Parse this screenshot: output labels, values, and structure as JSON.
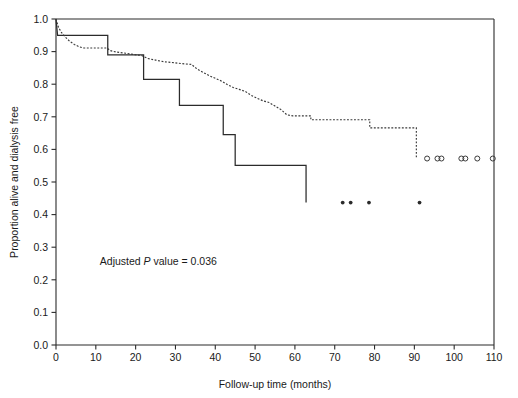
{
  "chart_data": {
    "type": "line",
    "title": "",
    "subtitle": "",
    "xlabel": "Follow-up time (months)",
    "ylabel": "Proportion alive and dialysis free",
    "xlim": [
      0,
      110
    ],
    "ylim": [
      0.0,
      1.0
    ],
    "xticks": [
      0,
      10,
      20,
      30,
      40,
      50,
      60,
      70,
      80,
      90,
      100,
      110
    ],
    "xticklabels": [
      "0",
      "10",
      "20",
      "30",
      "40",
      "50",
      "60",
      "70",
      "80",
      "90",
      "100",
      "110"
    ],
    "yticks": [
      0.0,
      0.1,
      0.2,
      0.3,
      0.4,
      0.5,
      0.6,
      0.7,
      0.8,
      0.9,
      1.0
    ],
    "yticklabels": [
      "0.0",
      "0.1",
      "0.2",
      "0.3",
      "0.4",
      "0.5",
      "0.6",
      "0.7",
      "0.8",
      "0.9",
      "1.0"
    ],
    "grid": false,
    "legend": "none",
    "annotations": [
      {
        "name": "adjusted-p-value",
        "text_before": "Adjusted ",
        "text_italic": "P",
        "text_after": " value = 0.036",
        "x": 11,
        "y": 0.245
      }
    ],
    "series": [
      {
        "name": "group-solid",
        "style": "solid",
        "color": "#2b2b2b",
        "step": "post",
        "points": [
          {
            "x": 0,
            "y": 1.0
          },
          {
            "x": 0.4,
            "y": 0.95
          },
          {
            "x": 13.0,
            "y": 0.95
          },
          {
            "x": 13.0,
            "y": 0.89
          },
          {
            "x": 22.0,
            "y": 0.89
          },
          {
            "x": 22.0,
            "y": 0.815
          },
          {
            "x": 31.0,
            "y": 0.815
          },
          {
            "x": 31.0,
            "y": 0.735
          },
          {
            "x": 42.0,
            "y": 0.735
          },
          {
            "x": 42.0,
            "y": 0.645
          },
          {
            "x": 45.0,
            "y": 0.645
          },
          {
            "x": 45.0,
            "y": 0.551
          },
          {
            "x": 62.8,
            "y": 0.551
          },
          {
            "x": 62.8,
            "y": 0.437
          }
        ],
        "censor_marker": "filled-dot",
        "censor_points": [
          {
            "x": 72.0,
            "y": 0.437
          },
          {
            "x": 74.0,
            "y": 0.437
          },
          {
            "x": 78.6,
            "y": 0.437
          },
          {
            "x": 91.3,
            "y": 0.437
          }
        ]
      },
      {
        "name": "group-dotted",
        "style": "dotted",
        "color": "#3a3a3a",
        "step": "post",
        "points": [
          {
            "x": 0.0,
            "y": 1.0
          },
          {
            "x": 0.6,
            "y": 0.975
          },
          {
            "x": 1.4,
            "y": 0.958
          },
          {
            "x": 2.4,
            "y": 0.944
          },
          {
            "x": 3.4,
            "y": 0.932
          },
          {
            "x": 4.6,
            "y": 0.922
          },
          {
            "x": 5.8,
            "y": 0.915
          },
          {
            "x": 7.0,
            "y": 0.911
          },
          {
            "x": 12.8,
            "y": 0.911
          },
          {
            "x": 13.6,
            "y": 0.903
          },
          {
            "x": 15.0,
            "y": 0.899
          },
          {
            "x": 17.5,
            "y": 0.895
          },
          {
            "x": 19.5,
            "y": 0.891
          },
          {
            "x": 21.5,
            "y": 0.888
          },
          {
            "x": 23.0,
            "y": 0.879
          },
          {
            "x": 25.0,
            "y": 0.874
          },
          {
            "x": 27.0,
            "y": 0.869
          },
          {
            "x": 29.5,
            "y": 0.866
          },
          {
            "x": 32.5,
            "y": 0.862
          },
          {
            "x": 34.0,
            "y": 0.861
          },
          {
            "x": 35.5,
            "y": 0.846
          },
          {
            "x": 37.0,
            "y": 0.836
          },
          {
            "x": 38.5,
            "y": 0.826
          },
          {
            "x": 40.0,
            "y": 0.818
          },
          {
            "x": 41.5,
            "y": 0.81
          },
          {
            "x": 43.0,
            "y": 0.799
          },
          {
            "x": 44.5,
            "y": 0.79
          },
          {
            "x": 46.0,
            "y": 0.784
          },
          {
            "x": 47.5,
            "y": 0.778
          },
          {
            "x": 49.0,
            "y": 0.766
          },
          {
            "x": 50.5,
            "y": 0.757
          },
          {
            "x": 52.0,
            "y": 0.749
          },
          {
            "x": 53.5,
            "y": 0.744
          },
          {
            "x": 55.0,
            "y": 0.733
          },
          {
            "x": 56.5,
            "y": 0.722
          },
          {
            "x": 58.0,
            "y": 0.706
          },
          {
            "x": 59.5,
            "y": 0.703
          },
          {
            "x": 64.0,
            "y": 0.703
          },
          {
            "x": 64.0,
            "y": 0.691
          },
          {
            "x": 78.8,
            "y": 0.691
          },
          {
            "x": 78.8,
            "y": 0.666
          },
          {
            "x": 90.5,
            "y": 0.666
          },
          {
            "x": 90.5,
            "y": 0.572
          }
        ],
        "censor_marker": "open-circle",
        "censor_points": [
          {
            "x": 93.2,
            "y": 0.572
          },
          {
            "x": 95.8,
            "y": 0.572
          },
          {
            "x": 96.8,
            "y": 0.572
          },
          {
            "x": 101.8,
            "y": 0.572
          },
          {
            "x": 102.8,
            "y": 0.572
          },
          {
            "x": 105.8,
            "y": 0.572
          },
          {
            "x": 109.7,
            "y": 0.572
          }
        ]
      }
    ]
  },
  "figure": {
    "axis_color": "#2b2b2b",
    "background": "#ffffff"
  }
}
